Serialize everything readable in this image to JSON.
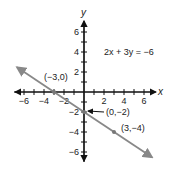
{
  "chart_data": {
    "type": "line",
    "title": "",
    "equation": "2x + 3y = −6",
    "xlabel": "x",
    "ylabel": "y",
    "xlim": [
      -7,
      7
    ],
    "ylim": [
      -7,
      7
    ],
    "x_ticks": [
      -6,
      -4,
      -2,
      2,
      4,
      6
    ],
    "y_ticks": [
      6,
      4,
      2,
      -2,
      -4,
      -6
    ],
    "x_tick_labels": [
      "−6",
      "−4",
      "−2",
      "2",
      "4",
      "6"
    ],
    "y_tick_labels": [
      "6",
      "4",
      "2",
      "−2",
      "−4",
      "−6"
    ],
    "series": [
      {
        "name": "2x + 3y = −6",
        "slope": -0.6667,
        "intercept": -2,
        "color": "#888888"
      }
    ],
    "points": [
      {
        "x": -3,
        "y": 0,
        "label": "(−3,0)"
      },
      {
        "x": 0,
        "y": -2,
        "label": "(0,−2)"
      },
      {
        "x": 3,
        "y": -4,
        "label": "(3,−4)"
      }
    ],
    "grid": false
  }
}
